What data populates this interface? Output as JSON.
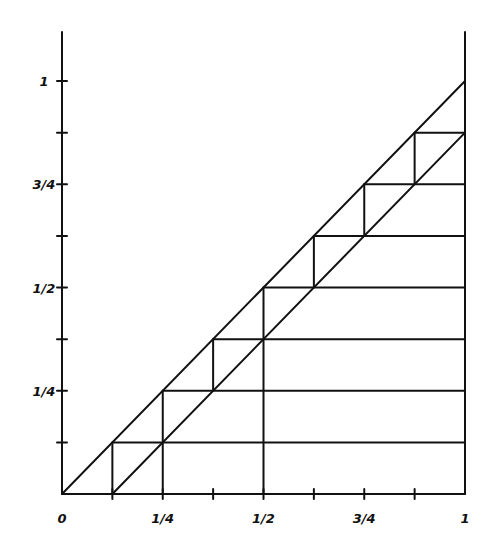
{
  "diagram": {
    "type": "staircase-between-lines",
    "x_axis": {
      "ticks": [
        0,
        0.125,
        0.25,
        0.375,
        0.5,
        0.625,
        0.75,
        0.875,
        1
      ],
      "labels": [
        {
          "value": 0,
          "text": "0"
        },
        {
          "value": 0.25,
          "text": "1/4"
        },
        {
          "value": 0.5,
          "text": "1/2"
        },
        {
          "value": 0.75,
          "text": "3/4"
        },
        {
          "value": 1,
          "text": "1"
        }
      ]
    },
    "y_axis": {
      "ticks": [
        0.125,
        0.25,
        0.375,
        0.5,
        0.625,
        0.75,
        0.875,
        1
      ],
      "labels": [
        {
          "value": 0.25,
          "text": "1/4"
        },
        {
          "value": 0.5,
          "text": "1/2"
        },
        {
          "value": 0.75,
          "text": "3/4"
        },
        {
          "value": 1,
          "text": "1"
        }
      ]
    },
    "lines": {
      "upper_diagonal": [
        [
          0,
          0
        ],
        [
          1,
          1
        ]
      ],
      "lower_diagonal": [
        [
          0.125,
          0
        ],
        [
          1,
          0.875
        ]
      ]
    },
    "horizontal_levels": [
      0.125,
      0.25,
      0.375,
      0.5,
      0.625,
      0.75,
      0.875
    ],
    "vertical_segments": [
      {
        "x": 0.125,
        "y0": 0,
        "y1": 0.125
      },
      {
        "x": 0.25,
        "y0": 0,
        "y1": 0.25
      },
      {
        "x": 0.375,
        "y0": 0.25,
        "y1": 0.375
      },
      {
        "x": 0.5,
        "y0": 0,
        "y1": 0.5
      },
      {
        "x": 0.625,
        "y0": 0.5,
        "y1": 0.625
      },
      {
        "x": 0.75,
        "y0": 0.625,
        "y1": 0.75
      },
      {
        "x": 0.875,
        "y0": 0.75,
        "y1": 0.875
      }
    ]
  }
}
